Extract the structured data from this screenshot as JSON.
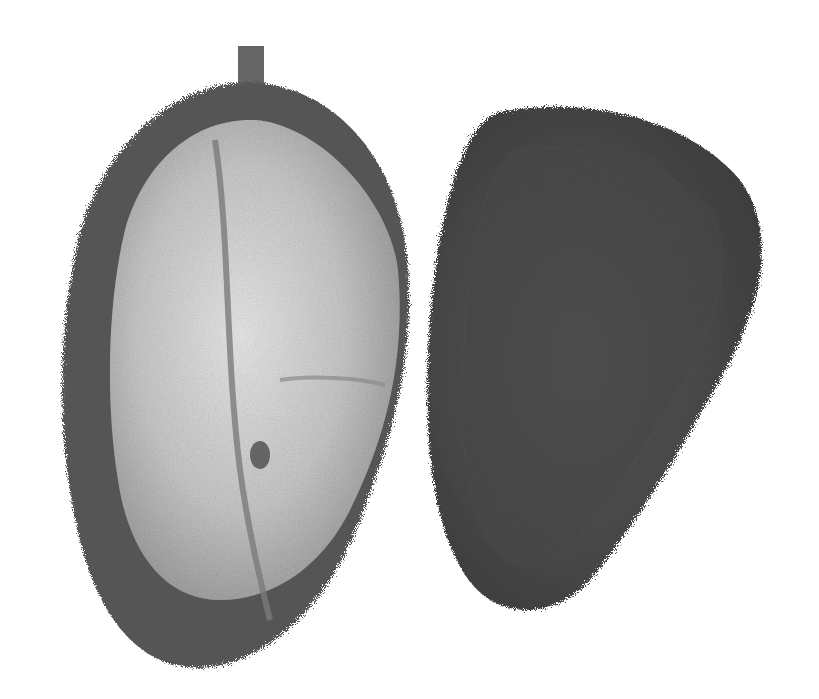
{
  "image": {
    "description": "Grayscale photograph of two durian fruits on a white background: left one cut open showing pale flesh pods, right one whole with spiky husk",
    "background": "#ffffff",
    "palette": {
      "husk_dark": "#4a4a4a",
      "husk_mid": "#5e5e5e",
      "flesh_light": "#d8d8d8",
      "flesh_mid": "#b5b5b5",
      "stem": "#6a6a6a"
    },
    "subjects": [
      {
        "name": "opened-durian",
        "position": "left",
        "state": "cut open, flesh visible",
        "has_stem": true
      },
      {
        "name": "whole-durian-half",
        "position": "right",
        "state": "spiky husk exterior"
      }
    ]
  }
}
